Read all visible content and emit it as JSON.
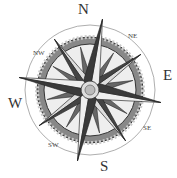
{
  "compass": {
    "cardinals": {
      "n": "N",
      "e": "E",
      "s": "S",
      "w": "W"
    },
    "intercardinals": {
      "ne": "NE",
      "se": "SE",
      "sw": "SW",
      "nw": "NW"
    },
    "rotation_deg": 10,
    "colors": {
      "dark": "#3a3a3a",
      "mid": "#8a8a8a",
      "light": "#e6e6e6",
      "ring": "#777777"
    }
  }
}
